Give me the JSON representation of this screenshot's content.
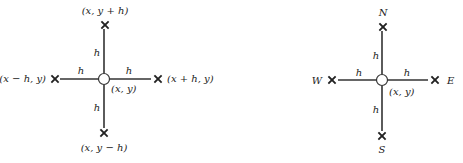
{
  "diagrams": [
    {
      "id": "coordinate-stencil",
      "center": {
        "label": "(x, y)"
      },
      "step_label": "h",
      "neighbors": {
        "top": "(x, y + h)",
        "bottom": "(x, y − h)",
        "left": "(x − h, y)",
        "right": "(x + h, y)"
      },
      "edge_labels": {
        "top": "h",
        "bottom": "h",
        "left": "h",
        "right": "h"
      }
    },
    {
      "id": "compass-stencil",
      "center": {
        "label": "(x, y)"
      },
      "step_label": "h",
      "neighbors": {
        "top": "N",
        "bottom": "S",
        "left": "W",
        "right": "E"
      },
      "edge_labels": {
        "top": "h",
        "bottom": "h",
        "left": "h",
        "right": "h"
      }
    }
  ],
  "colors": {
    "ink": "#222222",
    "background": "#ffffff"
  }
}
